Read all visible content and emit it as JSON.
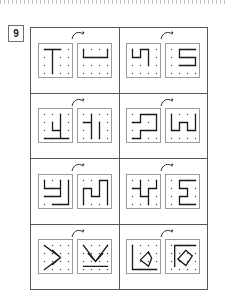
{
  "page": {
    "task_number": "9",
    "title_visible": false
  },
  "worksheet": {
    "type": "mental-rotation-dot-grid",
    "grid": {
      "rows": 4,
      "cols": 2,
      "items_per_cell": 2
    },
    "tile": {
      "dot_rows": 4,
      "dot_cols": 4,
      "dot_color": "#444444",
      "border_color": "#9a9a9a",
      "stroke_color": "#1b1b1b"
    },
    "arrow": {
      "name": "rotation-arrow",
      "direction": "clockwise",
      "color": "#1b1b1b"
    },
    "cells": [
      {
        "id": "r1c1",
        "left": {
          "name": "figure-a",
          "path": "M 1,0 L 1,3 M 0,0 L 2,0"
        },
        "right": {
          "name": "figure-b",
          "path": "M 0,1 L 3,1 M 3,1 L 3,0 M 0,1 L 0,0"
        }
      },
      {
        "id": "r1c2",
        "left": {
          "name": "figure-a",
          "path": "M 0,0 L 0,1 L 1,1 L 1,0 L 2,0 L 2,2"
        },
        "right": {
          "name": "figure-b",
          "path": "M 3,0 L 1,0 L 1,1 L 3,1 L 3,2 L 1,2"
        }
      },
      {
        "id": "r2c1",
        "left": {
          "name": "figure-a",
          "path": "M 2,0 L 2,2 L 1,2 L 1,1 M 0,3 L 3,3 M 2,2 L 2,3"
        },
        "right": {
          "name": "figure-b",
          "path": "M 0,1 L 1,1 L 1,3 M 1,1 L 1,0 M 2,1 L 2,3"
        }
      },
      {
        "id": "r2c2",
        "left": {
          "name": "figure-a",
          "path": "M 0,1 L 1,1 L 1,0 L 3,0 L 3,2 L 1,2 L 1,3 L 0,3"
        },
        "right": {
          "name": "figure-b",
          "path": "M 0,0 L 0,2 L 1,2 L 1,1 L 2,1 L 2,2 L 3,2 L 3,0"
        }
      },
      {
        "id": "r3c1",
        "left": {
          "name": "figure-a",
          "path": "M 0,0 L 0,1 L 2,1 L 2,2 L 0,2 M 2,0 L 2,1 M 3,0 L 3,3 L 1,3"
        },
        "right": {
          "name": "figure-b",
          "path": "M 0,3 L 0,1 L 1,1 L 1,2 L 2,2 L 2,0 L 3,0 L 3,3"
        }
      },
      {
        "id": "r3c2",
        "left": {
          "name": "figure-a",
          "path": "M 0,1 L 1,1 L 1,2 L 2,2 L 2,1 L 3,1 L 3,0 M 1,1 L 1,0 M 2,2 L 2,3"
        },
        "right": {
          "name": "figure-b",
          "path": "M 3,0 L 1,0 L 1,1 L 2,1 L 2,2 L 1,2 L 1,3 L 3,3"
        }
      },
      {
        "id": "r4c1",
        "left": {
          "name": "figure-a",
          "path": "M 0,0 L 2,1.5 L 0,3 M 1,0.6 L 2,1.5 L 1,2.4"
        },
        "right": {
          "name": "figure-b",
          "path": "M 0,0 L 1.5,2 L 3,0 M 0.6,1 L 1.5,2 L 2.4,1 M 0,2.6 L 3,2.6"
        }
      },
      {
        "id": "r4c2",
        "left": {
          "name": "figure-a",
          "path": "M 0,0 L 0,3 L 3,3 M 2,0.8 L 1,1.8 L 2,2.6 L 2.4,1.6 Z"
        },
        "right": {
          "name": "figure-b",
          "path": "M 3,0 L 0.4,0 L 0.4,2.6 M 1.8,0.6 L 0.8,1.7 L 1.8,2.5 L 2.6,1.3 Z"
        }
      }
    ]
  }
}
